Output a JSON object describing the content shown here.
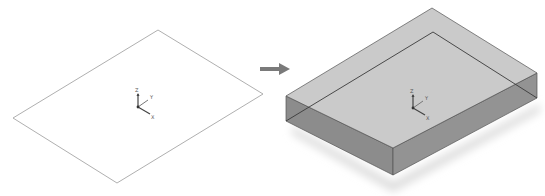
{
  "diagram": {
    "title": "",
    "stages": [
      {
        "id": "sketch",
        "shape": "planar-rectangle-sketch",
        "stroke_color": "#9a9a9a",
        "fill_color": "#ffffff",
        "triad": {
          "labels": {
            "z": "Z",
            "y": "Y",
            "x": "X"
          }
        }
      },
      {
        "id": "extruded-solid",
        "shape": "rectangular-box",
        "top_color": "#c6c6c6",
        "side_left_color": "#8c8c8c",
        "side_right_color": "#939393",
        "edge_color": "#555555",
        "hidden_edge_color": "#3a3a3a",
        "shadow_color": "#dcdcdc",
        "triad": {
          "labels": {
            "z": "Z",
            "y": "Y",
            "x": "X"
          }
        }
      }
    ],
    "arrow": {
      "direction": "right",
      "color": "#7a7a7a"
    }
  }
}
